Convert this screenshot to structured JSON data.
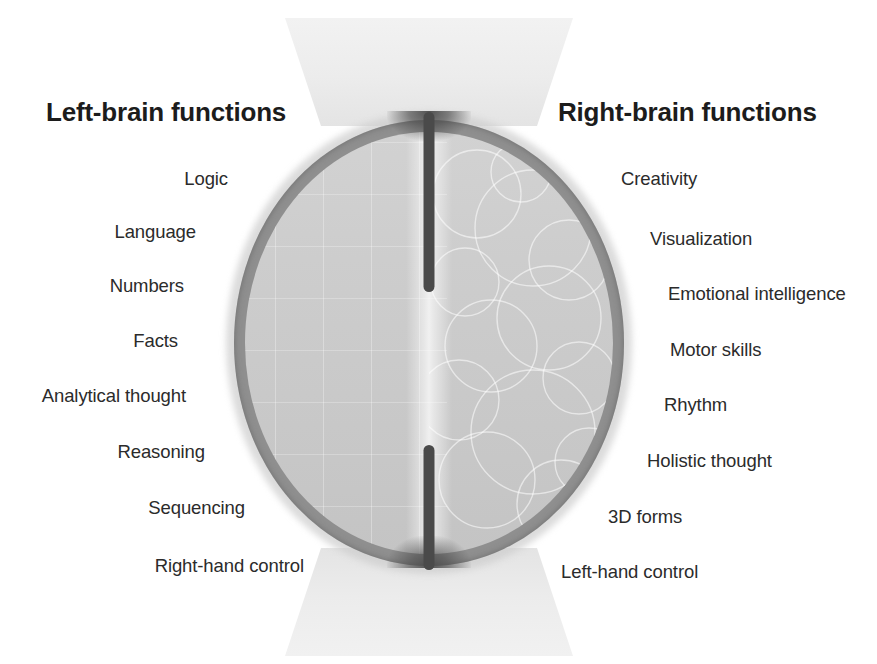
{
  "figure": {
    "title_left": "Left-brain functions",
    "title_right": "Right-brain functions",
    "brain_icon": "brain-illustration",
    "colors": {
      "text": "#2b2b2b",
      "heading": "#1c1c1c",
      "fissure": "#4a4a4a",
      "ring": "#8f8f8f",
      "matter": "#cdcdcd",
      "background": "#ffffff"
    }
  },
  "left": {
    "heading": "Left-brain functions",
    "items": [
      {
        "label": "Logic",
        "x": 228,
        "y": 168
      },
      {
        "label": "Language",
        "x": 196,
        "y": 221
      },
      {
        "label": "Numbers",
        "x": 184,
        "y": 275
      },
      {
        "label": "Facts",
        "x": 178,
        "y": 330
      },
      {
        "label": "Analytical thought",
        "x": 186,
        "y": 385
      },
      {
        "label": "Reasoning",
        "x": 205,
        "y": 441
      },
      {
        "label": "Sequencing",
        "x": 245,
        "y": 497
      },
      {
        "label": "Right-hand control",
        "x": 304,
        "y": 555
      }
    ]
  },
  "right": {
    "heading": "Right-brain functions",
    "items": [
      {
        "label": "Creativity",
        "x": 621,
        "y": 168
      },
      {
        "label": "Visualization",
        "x": 650,
        "y": 228
      },
      {
        "label": "Emotional intelligence",
        "x": 668,
        "y": 283
      },
      {
        "label": "Motor skills",
        "x": 670,
        "y": 339
      },
      {
        "label": "Rhythm",
        "x": 664,
        "y": 394
      },
      {
        "label": "Holistic thought",
        "x": 647,
        "y": 450
      },
      {
        "label": "3D forms",
        "x": 608,
        "y": 506
      },
      {
        "label": "Left-hand control",
        "x": 561,
        "y": 561
      }
    ]
  }
}
